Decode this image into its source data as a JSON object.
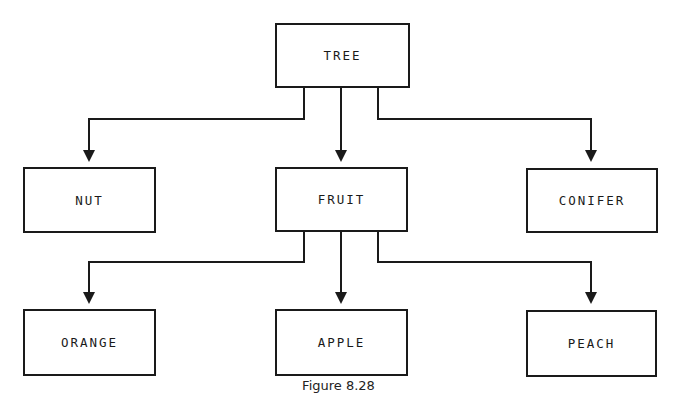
{
  "page_header": "MODULES AND STRUCTURE TREES   321",
  "diagram": {
    "type": "hierarchy-tree",
    "nodes": {
      "tree": "TREE",
      "nut": "NUT",
      "fruit": "FRUIT",
      "conifer": "CONIFER",
      "orange": "ORANGE",
      "apple": "APPLE",
      "peach": "PEACH"
    },
    "edges": [
      [
        "TREE",
        "NUT"
      ],
      [
        "TREE",
        "FRUIT"
      ],
      [
        "TREE",
        "CONIFER"
      ],
      [
        "FRUIT",
        "ORANGE"
      ],
      [
        "FRUIT",
        "APPLE"
      ],
      [
        "FRUIT",
        "PEACH"
      ]
    ],
    "line_color": "#1a1a1a"
  },
  "caption": "Figure 8.28"
}
